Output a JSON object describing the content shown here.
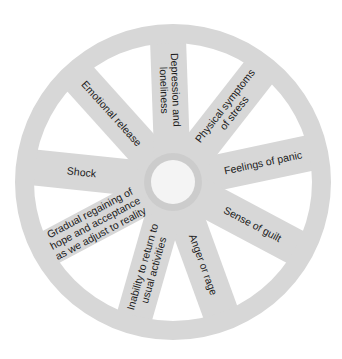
{
  "diagram": {
    "type": "wheel",
    "colors": {
      "background": "#ffffff",
      "wheel": "#d7d7d7",
      "hub_ring": "#cccccc",
      "hub": "#f4f4f4",
      "text": "#1a1a1a"
    },
    "geometry": {
      "cx": 173,
      "cy": 182,
      "rim_outer_r": 158,
      "rim_inner_r": 139,
      "hub_ring_r": 29,
      "hub_r": 22,
      "spoke_width": 36
    },
    "spokes": [
      {
        "id": "feelings-of-panic",
        "angle": -12,
        "lines": [
          "Feelings of panic"
        ],
        "text_r": 92
      },
      {
        "id": "sense-of-guilt",
        "angle": 28,
        "lines": [
          "Sense of guilt"
        ],
        "text_r": 90
      },
      {
        "id": "anger-or-rage",
        "angle": 70,
        "lines": [
          "Anger or rage"
        ],
        "text_r": 88
      },
      {
        "id": "inability-to-return",
        "angle": 106,
        "lines": [
          "Inability to return to",
          "usual activities"
        ],
        "text_r": 90
      },
      {
        "id": "gradual-regaining",
        "angle": 152,
        "lines": [
          "Gradual regaining of",
          "hope and acceptance",
          "as we adjust to reality"
        ],
        "text_r": 88
      },
      {
        "id": "shock",
        "angle": 186,
        "lines": [
          "Shock"
        ],
        "text_r": 92
      },
      {
        "id": "emotional-release",
        "angle": 228,
        "lines": [
          "Emotional release"
        ],
        "text_r": 92
      },
      {
        "id": "depression-and-loneliness",
        "angle": 268,
        "lines": [
          "Depression and",
          "loneliness"
        ],
        "text_r": 92
      },
      {
        "id": "physical-symptoms",
        "angle": 308,
        "lines": [
          "Physical symptoms",
          "of stress"
        ],
        "text_r": 92
      }
    ]
  }
}
